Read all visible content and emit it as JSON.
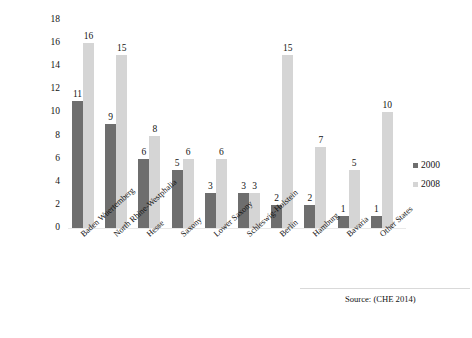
{
  "chart_data": {
    "type": "bar",
    "title": "",
    "xlabel": "",
    "ylabel": "",
    "ylim": [
      0,
      18
    ],
    "yticks": [
      0,
      2,
      4,
      6,
      8,
      10,
      12,
      14,
      16,
      18
    ],
    "grid": false,
    "legend_position": "right",
    "categories": [
      "Baden Wuertemberg",
      "North Rhine-Westphalia",
      "Hesse",
      "Saxony",
      "Lower Saxony",
      "Schleswig-Holstein",
      "Berlin",
      "Hamburg",
      "Bavaria",
      "Other States"
    ],
    "series": [
      {
        "name": "2000",
        "color": "#6e6e6e",
        "values": [
          11,
          9,
          6,
          5,
          3,
          3,
          2,
          2,
          1,
          1
        ]
      },
      {
        "name": "2008",
        "color": "#d5d5d5",
        "values": [
          16,
          15,
          8,
          6,
          6,
          3,
          15,
          7,
          5,
          10
        ]
      }
    ],
    "annotations": {
      "source": "Source: (CHE 2014)"
    }
  },
  "legend": {
    "items": [
      {
        "label": "2000",
        "color": "#6e6e6e"
      },
      {
        "label": "2008",
        "color": "#d5d5d5"
      }
    ]
  },
  "footer": {
    "source": "Source: (CHE 2014)",
    "caption": ""
  }
}
